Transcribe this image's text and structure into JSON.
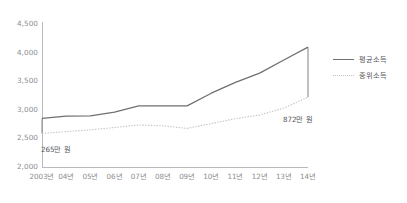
{
  "chart_data": {
    "type": "line",
    "title": "",
    "xlabel": "",
    "ylabel": "",
    "ylim": [
      2000,
      4500
    ],
    "yticks": [
      "2,000",
      "2,500",
      "3,000",
      "3,500",
      "4,000",
      "4,500"
    ],
    "ytick_values": [
      2000,
      2500,
      3000,
      3500,
      4000,
      4500
    ],
    "grid": false,
    "legend_position": "right",
    "categories": [
      "2003년",
      "04년",
      "05년",
      "06년",
      "07년",
      "08년",
      "09년",
      "10년",
      "11년",
      "12년",
      "13년",
      "14년"
    ],
    "series": [
      {
        "name": "평균소득",
        "style": "solid",
        "color": "#6f7073",
        "values": [
          2850,
          2890,
          2895,
          2960,
          3070,
          3070,
          3070,
          3290,
          3480,
          3640,
          3870,
          4095
        ]
      },
      {
        "name": "중위소득",
        "style": "dotted",
        "color": "#c2c3c6",
        "values": [
          2585,
          2620,
          2650,
          2690,
          2735,
          2720,
          2675,
          2760,
          2845,
          2910,
          3030,
          3220
        ]
      }
    ],
    "annotations": [
      {
        "text": "265만 원",
        "category": "2003년",
        "note": "gap between 평균소득 and 중위소득 at 2003년"
      },
      {
        "text": "872만 원",
        "category": "14년",
        "note": "gap between 평균소득 and 중위소득 at 14년"
      }
    ],
    "connectors": [
      {
        "category": "2003년",
        "top": 2850,
        "bottom": 2585
      },
      {
        "category": "14년",
        "top": 4095,
        "bottom": 3220
      }
    ]
  },
  "legend": {
    "items": [
      {
        "label": "평균소득",
        "style": "solid"
      },
      {
        "label": "중위소득",
        "style": "dotted"
      }
    ]
  }
}
